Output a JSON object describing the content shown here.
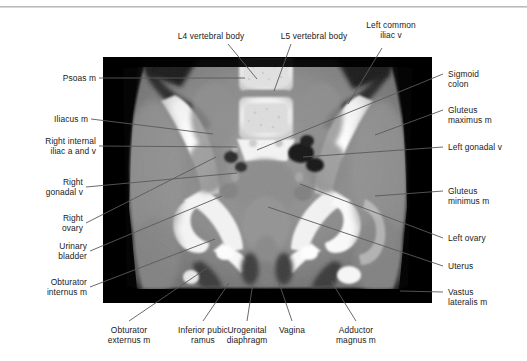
{
  "figure": {
    "kind": "ct-scan-annotated-anatomy",
    "modality": "CT",
    "view": "coronal-pelvis",
    "top_rule_color": "#b9b9b9",
    "image_background": "#000000",
    "leader_line_color": "#5a5a5a",
    "text_color": "#1a1a1a"
  },
  "labels": {
    "top": [
      {
        "id": "l4-vertebral-body",
        "text": "L4 vertebral body"
      },
      {
        "id": "l5-vertebral-body",
        "text": "L5 vertebral body"
      },
      {
        "id": "left-common-iliac-v",
        "text": "Left common\niliac v"
      }
    ],
    "left": [
      {
        "id": "psoas-m",
        "text": "Psoas m"
      },
      {
        "id": "iliacus-m",
        "text": "Iliacus m"
      },
      {
        "id": "right-internal-iliac-a-and-v",
        "text": "Right internal\niliac a and v"
      },
      {
        "id": "right-gonadal-v",
        "text": "Right\ngonadal v"
      },
      {
        "id": "right-ovary",
        "text": "Right\novary"
      },
      {
        "id": "urinary-bladder",
        "text": "Urinary\nbladder"
      },
      {
        "id": "obturator-internus-m",
        "text": "Obturator\ninternus m"
      }
    ],
    "right": [
      {
        "id": "sigmoid-colon",
        "text": "Sigmoid\ncolon"
      },
      {
        "id": "gluteus-maximus-m",
        "text": "Gluteus\nmaximus m"
      },
      {
        "id": "left-gonadal-v",
        "text": "Left gonadal v"
      },
      {
        "id": "gluteus-minimus-m",
        "text": "Gluteus\nminimus m"
      },
      {
        "id": "left-ovary",
        "text": "Left ovary"
      },
      {
        "id": "uterus",
        "text": "Uterus"
      },
      {
        "id": "vastus-lateralis-m",
        "text": "Vastus\nlateralis m"
      }
    ],
    "bottom": [
      {
        "id": "obturator-externus-m",
        "text": "Obturator\nexternus m"
      },
      {
        "id": "inferior-pubic-ramus",
        "text": "Inferior pubic\nramus"
      },
      {
        "id": "urogenital-diaphragm",
        "text": "Urogenital\ndiaphragm"
      },
      {
        "id": "vagina",
        "text": "Vagina"
      },
      {
        "id": "adductor-magnus-m",
        "text": "Adductor\nmagnus m"
      }
    ]
  }
}
